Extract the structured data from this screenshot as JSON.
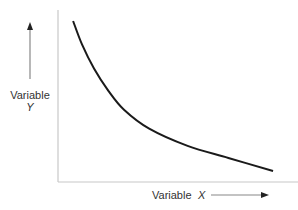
{
  "chart_data": {
    "type": "line",
    "title": "",
    "xlabel": "Variable",
    "xlabel_var": "X",
    "ylabel": "Variable",
    "ylabel_var": "Y",
    "xlim": [
      0,
      10
    ],
    "ylim": [
      0,
      10
    ],
    "grid": false,
    "legend": "none",
    "series": [
      {
        "name": "curve",
        "x": [
          0.63,
          1.0,
          1.5,
          2.1,
          2.75,
          3.8,
          5.4,
          7.1,
          8.96
        ],
        "y": [
          9.36,
          8.0,
          6.6,
          5.3,
          4.2,
          3.1,
          2.1,
          1.4,
          0.64
        ]
      }
    ]
  },
  "colors": {
    "curve": "#1a1a1a",
    "axis": "#c8c8c8",
    "arrow": "#555555",
    "text": "#333333"
  }
}
